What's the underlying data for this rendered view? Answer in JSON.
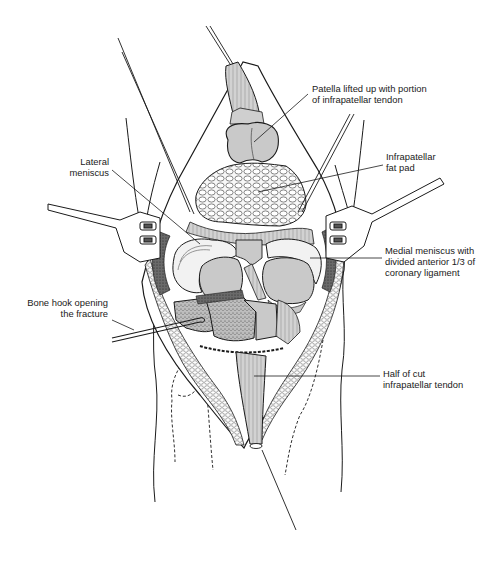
{
  "figure": {
    "colors": {
      "line": "#1a1a1a",
      "structure_fill": "#c9c9c9",
      "background": "#ffffff",
      "fat_fill": "#f4f4f4"
    }
  },
  "labels": [
    {
      "id": "patella",
      "lines": [
        "Patella lifted up with portion",
        "of infrapatellar tendon"
      ]
    },
    {
      "id": "fat_pad",
      "lines": [
        "Infrapatellar",
        "fat pad"
      ]
    },
    {
      "id": "lateral_meniscus",
      "lines": [
        "Lateral",
        "meniscus"
      ]
    },
    {
      "id": "medial_meniscus",
      "lines": [
        "Medial meniscus with",
        "divided anterior 1/3 of",
        "coronary ligament"
      ]
    },
    {
      "id": "bone_hook",
      "lines": [
        "Bone hook opening",
        "the fracture"
      ]
    },
    {
      "id": "cut_tendon",
      "lines": [
        "Half of cut",
        "infrapatellar tendon"
      ]
    }
  ]
}
